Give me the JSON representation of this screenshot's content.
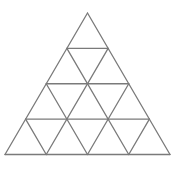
{
  "diagram": {
    "type": "triangular-grid",
    "rows": 4,
    "apex": [
      87.5,
      13
    ],
    "base_left": [
      5,
      154.5
    ],
    "base_right": [
      170,
      154.5
    ],
    "stroke_color": "#7a7a7a",
    "stroke_width": 1.3,
    "background": "#ffffff"
  }
}
